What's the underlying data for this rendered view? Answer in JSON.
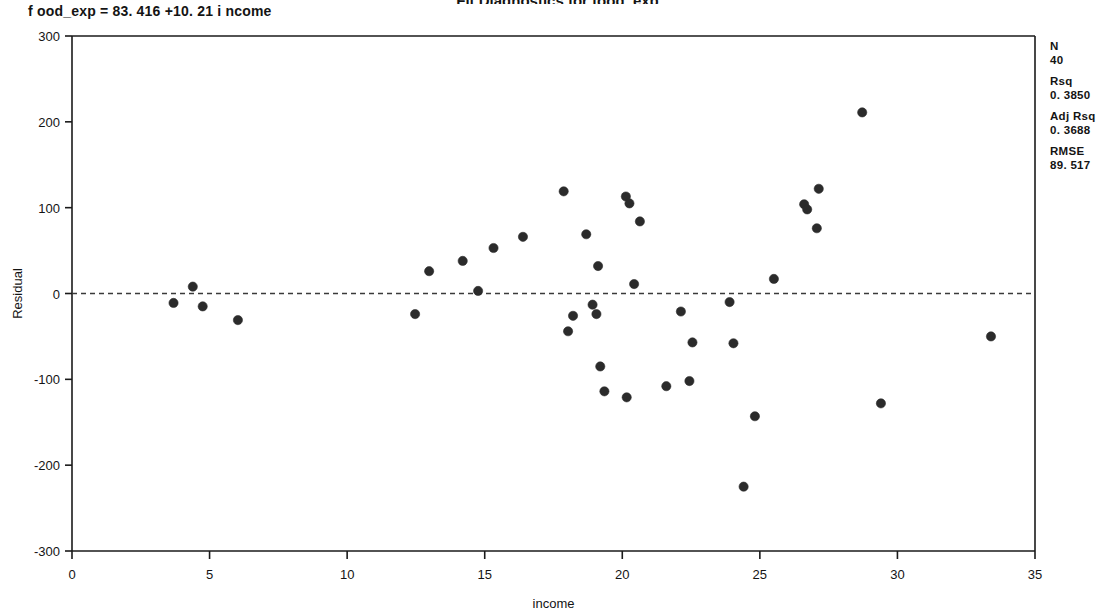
{
  "chart_data": {
    "type": "scatter",
    "title": "Fit Diagnostics for food_exp",
    "equation": "food_exp = 83.416 +10.21 income",
    "xlabel": "income",
    "ylabel": "Residual",
    "xlim": [
      0,
      35
    ],
    "ylim": [
      -300,
      300
    ],
    "xticks": [
      0,
      5,
      10,
      15,
      20,
      25,
      30,
      35
    ],
    "yticks": [
      300,
      200,
      100,
      0,
      -100,
      -200,
      -300
    ],
    "grid": false,
    "legend": "none",
    "reference_line": {
      "orientation": "horizontal",
      "y": 0,
      "style": "dashed"
    },
    "series": [
      {
        "name": "Residual",
        "marker": "filled-circle",
        "color": "#2b2b2b",
        "points": [
          {
            "x": 3.69,
            "y": -11
          },
          {
            "x": 4.39,
            "y": 8
          },
          {
            "x": 4.75,
            "y": -15
          },
          {
            "x": 6.03,
            "y": -31
          },
          {
            "x": 12.47,
            "y": -24
          },
          {
            "x": 12.98,
            "y": 26
          },
          {
            "x": 14.2,
            "y": 38
          },
          {
            "x": 14.76,
            "y": 3
          },
          {
            "x": 15.32,
            "y": 53
          },
          {
            "x": 16.39,
            "y": 66
          },
          {
            "x": 17.87,
            "y": 119
          },
          {
            "x": 18.03,
            "y": -44
          },
          {
            "x": 18.21,
            "y": -26
          },
          {
            "x": 18.69,
            "y": 69
          },
          {
            "x": 18.92,
            "y": -13
          },
          {
            "x": 19.06,
            "y": -24
          },
          {
            "x": 19.12,
            "y": 32
          },
          {
            "x": 19.2,
            "y": -85
          },
          {
            "x": 19.35,
            "y": -114
          },
          {
            "x": 20.13,
            "y": 113
          },
          {
            "x": 20.26,
            "y": 105
          },
          {
            "x": 20.16,
            "y": -121
          },
          {
            "x": 20.43,
            "y": 11
          },
          {
            "x": 20.64,
            "y": 84
          },
          {
            "x": 21.6,
            "y": -108
          },
          {
            "x": 22.13,
            "y": -21
          },
          {
            "x": 22.44,
            "y": -102
          },
          {
            "x": 22.55,
            "y": -57
          },
          {
            "x": 23.9,
            "y": -10
          },
          {
            "x": 24.04,
            "y": -58
          },
          {
            "x": 24.41,
            "y": -225
          },
          {
            "x": 24.82,
            "y": -143
          },
          {
            "x": 25.51,
            "y": 17
          },
          {
            "x": 26.61,
            "y": 104
          },
          {
            "x": 26.72,
            "y": 98
          },
          {
            "x": 27.14,
            "y": 122
          },
          {
            "x": 27.07,
            "y": 76
          },
          {
            "x": 28.72,
            "y": 211
          },
          {
            "x": 29.4,
            "y": -128
          },
          {
            "x": 33.4,
            "y": -50
          }
        ]
      }
    ]
  },
  "stats": [
    {
      "label": "N",
      "value": "40"
    },
    {
      "label": "Rsq",
      "value": "0. 3850"
    },
    {
      "label": "Adj Rsq",
      "value": "0. 3688"
    },
    {
      "label": "RMSE",
      "value": "89. 517"
    }
  ],
  "equation_display": "f ood_exp  =  83. 416  +10. 21 i ncome"
}
